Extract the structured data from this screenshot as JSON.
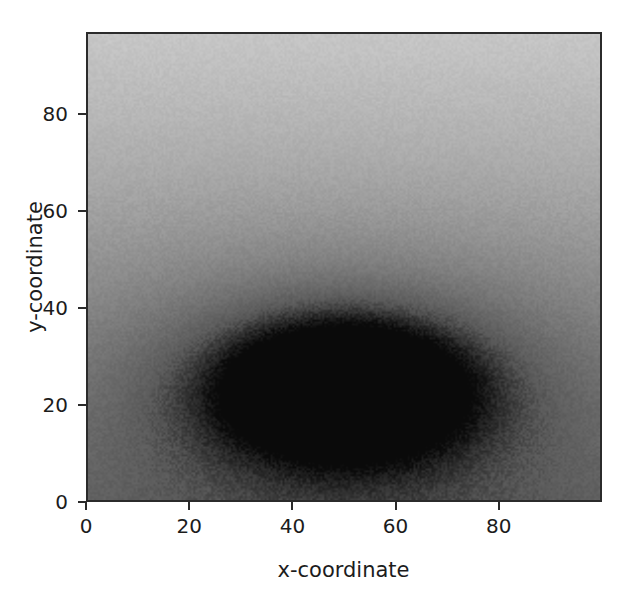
{
  "figure": {
    "background_color": "#ffffff",
    "plot": {
      "border_color": "#2b2b2b",
      "left_px": 86,
      "top_px": 32,
      "width_px": 516,
      "height_px": 470
    }
  },
  "axes": {
    "x": {
      "label": "x-coordinate",
      "ticks": [
        "0",
        "20",
        "40",
        "60",
        "80"
      ],
      "tick_values": [
        0,
        20,
        40,
        60,
        80
      ],
      "range": [
        0,
        100
      ]
    },
    "y": {
      "label": "y-coordinate",
      "ticks": [
        "0",
        "20",
        "40",
        "60",
        "80"
      ],
      "tick_values": [
        0,
        20,
        40,
        60,
        80
      ],
      "range": [
        0,
        97
      ],
      "inverted": true
    }
  },
  "chart_data": {
    "type": "heatmap",
    "title": "",
    "xlabel": "x-coordinate",
    "ylabel": "y-coordinate",
    "xlim": [
      0,
      100
    ],
    "ylim": [
      97,
      0
    ],
    "y_axis_inverted": true,
    "grid": false,
    "legend": "none",
    "colormap": "gray_reversed",
    "colormap_stops": [
      {
        "value": 0.0,
        "color": "#dcdcdc"
      },
      {
        "value": 0.35,
        "color": "#a8a8a8"
      },
      {
        "value": 0.6,
        "color": "#7d7d7d"
      },
      {
        "value": 0.8,
        "color": "#5a5a5a"
      },
      {
        "value": 1.0,
        "color": "#0a0a0a"
      }
    ],
    "value_range": [
      0,
      1
    ],
    "noise_amplitude": 0.035,
    "components": [
      {
        "name": "vertical-gradient",
        "kind": "linear-ramp",
        "axis": "y",
        "value_at_y_min": 0.14,
        "value_at_y_max": 0.7
      },
      {
        "name": "central-blob",
        "kind": "gaussian-2d",
        "center_x": 50,
        "center_y": 73,
        "sigma_x": 19,
        "sigma_y": 11,
        "amplitude": 0.62
      },
      {
        "name": "broad-halo",
        "kind": "gaussian-2d",
        "center_x": 52,
        "center_y": 72,
        "sigma_x": 40,
        "sigma_y": 24,
        "amplitude": 0.22
      }
    ],
    "sampled_grid": {
      "x": [
        0,
        10,
        20,
        30,
        40,
        50,
        60,
        70,
        80,
        90,
        100
      ],
      "y": [
        0,
        10,
        20,
        30,
        40,
        50,
        60,
        70,
        80,
        90,
        97
      ],
      "values": [
        [
          0.14,
          0.14,
          0.14,
          0.14,
          0.14,
          0.14,
          0.14,
          0.14,
          0.14,
          0.14,
          0.14
        ],
        [
          0.2,
          0.2,
          0.2,
          0.2,
          0.2,
          0.21,
          0.21,
          0.2,
          0.2,
          0.2,
          0.2
        ],
        [
          0.26,
          0.26,
          0.26,
          0.27,
          0.27,
          0.28,
          0.28,
          0.27,
          0.27,
          0.26,
          0.26
        ],
        [
          0.32,
          0.32,
          0.33,
          0.34,
          0.35,
          0.36,
          0.36,
          0.35,
          0.34,
          0.33,
          0.32
        ],
        [
          0.38,
          0.39,
          0.4,
          0.42,
          0.44,
          0.46,
          0.46,
          0.44,
          0.42,
          0.4,
          0.38
        ],
        [
          0.44,
          0.45,
          0.47,
          0.51,
          0.55,
          0.58,
          0.58,
          0.55,
          0.51,
          0.47,
          0.45
        ],
        [
          0.5,
          0.52,
          0.56,
          0.63,
          0.71,
          0.76,
          0.75,
          0.69,
          0.61,
          0.55,
          0.51
        ],
        [
          0.55,
          0.58,
          0.64,
          0.75,
          0.88,
          0.96,
          0.93,
          0.82,
          0.7,
          0.61,
          0.56
        ],
        [
          0.59,
          0.62,
          0.68,
          0.78,
          0.88,
          0.93,
          0.91,
          0.83,
          0.73,
          0.65,
          0.6
        ],
        [
          0.64,
          0.65,
          0.68,
          0.73,
          0.78,
          0.81,
          0.8,
          0.76,
          0.71,
          0.67,
          0.65
        ],
        [
          0.67,
          0.68,
          0.69,
          0.71,
          0.73,
          0.74,
          0.74,
          0.72,
          0.7,
          0.68,
          0.67
        ]
      ]
    }
  }
}
